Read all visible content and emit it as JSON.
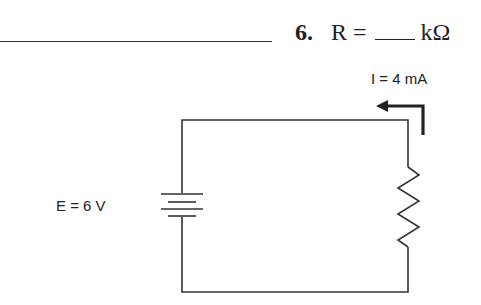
{
  "question": {
    "number": "6.",
    "lhs": "R =",
    "unit": "kΩ"
  },
  "circuit": {
    "current_label": "I = 4 mA",
    "voltage_label": "E = 6 V",
    "components": [
      {
        "type": "battery",
        "label": "E = 6 V"
      },
      {
        "type": "resistor",
        "label": "R"
      },
      {
        "type": "current-arrow",
        "label": "I = 4 mA",
        "direction": "counter-clockwise (upward through resistor, then left)"
      }
    ]
  },
  "colors": {
    "wire": "#333333",
    "text": "#222222",
    "background": "#ffffff"
  }
}
